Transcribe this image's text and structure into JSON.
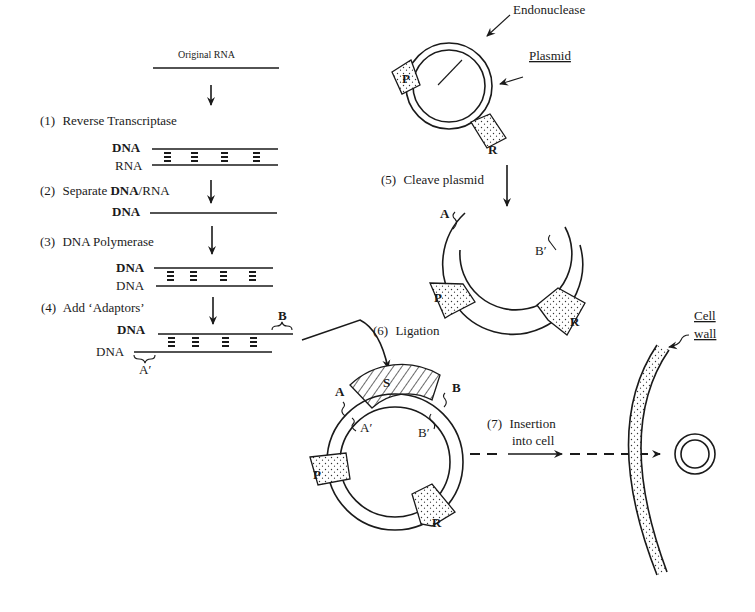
{
  "diagram": {
    "left_panel": {
      "top_label": "Original RNA",
      "steps": [
        {
          "number": "(1)",
          "label": "Reverse Transcriptase"
        },
        {
          "number": "(2)",
          "label_pre": "Separate ",
          "label_bold": "DNA",
          "label_post": "/RNA"
        },
        {
          "number": "(3)",
          "label": "DNA Polymerase"
        },
        {
          "number": "(4)",
          "label": "Add ‘Adaptors’"
        }
      ],
      "strand_labels": {
        "s1_top": "DNA",
        "s1_bottom": "RNA",
        "s2": "DNA",
        "s3_top": "DNA",
        "s3_bottom": "DNA",
        "s4_top": "DNA",
        "s4_bottom": "DNA",
        "adaptor_b": "B",
        "adaptor_a_prime": "A′"
      }
    },
    "plasmid": {
      "endonuclease_label": "Endonuclease",
      "plasmid_label": "Plasmid",
      "marker_p": "P",
      "marker_r": "R"
    },
    "step5": {
      "number": "(5)",
      "label": "Cleave plasmid",
      "end_a": "A",
      "end_b_prime": "B′"
    },
    "step6": {
      "number": "(6)",
      "label": "Ligation"
    },
    "recombinant": {
      "insert": "S",
      "a": "A",
      "a_prime": "A′",
      "b": "B",
      "b_prime": "B′",
      "marker_p": "P",
      "marker_r": "R"
    },
    "step7": {
      "number": "(7)",
      "line1": "Insertion",
      "line2": "into cell"
    },
    "cell": {
      "wall_line1": "Cell",
      "wall_line2": "wall"
    },
    "colors": {
      "ink": "#1a1a1a",
      "background": "#ffffff"
    }
  }
}
